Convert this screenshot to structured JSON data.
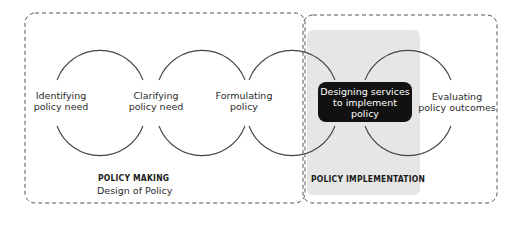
{
  "diagram": {
    "steps": [
      {
        "line1": "Identifying",
        "line2": "policy need"
      },
      {
        "line1": "Clarifying",
        "line2": "policy need"
      },
      {
        "line1": "Formulating",
        "line2": "policy"
      },
      {
        "line1": "Designing services",
        "line2": "to implement",
        "line3": "policy"
      },
      {
        "line1": "Evaluating",
        "line2": "policy outcomes"
      }
    ],
    "groups": {
      "policy_making": {
        "title": "POLICY MAKING",
        "subtitle": "Design of Policy"
      },
      "policy_implementation": {
        "title": "POLICY IMPLEMENTATION"
      }
    },
    "colors": {
      "highlight_panel": "#e6e6e6",
      "highlight_box": "#111111",
      "lines": "#444444"
    }
  }
}
